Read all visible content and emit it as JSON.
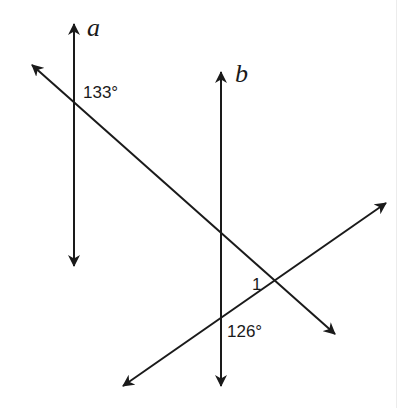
{
  "diagram": {
    "type": "parallel-lines-with-transversals",
    "colors": {
      "line": "#1a1a1a",
      "background": "#ffffff"
    },
    "lines": [
      {
        "id": "a",
        "label": "a",
        "x1": 74,
        "y1": 268,
        "x2": 74,
        "y2": 22
      },
      {
        "id": "b",
        "label": "b",
        "x1": 221,
        "y1": 388,
        "x2": 221,
        "y2": 70
      },
      {
        "id": "transversal-1",
        "label": "",
        "x1": 30,
        "y1": 63,
        "x2": 337,
        "y2": 336
      },
      {
        "id": "transversal-2",
        "label": "",
        "x1": 121,
        "y1": 388,
        "x2": 388,
        "y2": 202
      }
    ],
    "labels": {
      "line_a": "a",
      "line_b": "b",
      "angle_top": "133°",
      "angle_1": "1",
      "angle_bottom": "126°"
    }
  }
}
